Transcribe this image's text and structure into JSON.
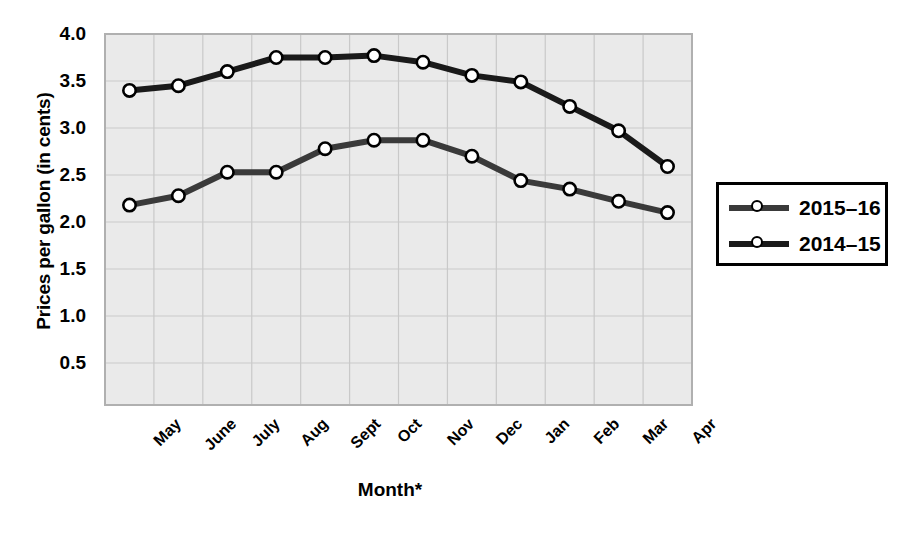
{
  "chart_data": {
    "type": "line",
    "title": "",
    "subtitle": "",
    "xlabel": "Month*",
    "ylabel": "Prices per gallon (in cents)",
    "categories": [
      "May",
      "June",
      "July",
      "Aug",
      "Sept",
      "Oct",
      "Nov",
      "Dec",
      "Jan",
      "Feb",
      "Mar",
      "Apr"
    ],
    "ylim": [
      0.25,
      4.0
    ],
    "yticks": [
      "4.0",
      "3.5",
      "3.0",
      "2.5",
      "2.0",
      "1.5",
      "1.0",
      "0.5"
    ],
    "ytick_values": [
      4.0,
      3.5,
      3.0,
      2.5,
      2.0,
      1.5,
      1.0,
      0.5
    ],
    "grid": true,
    "legend_position": "right",
    "series": [
      {
        "name": "2015–16",
        "color": "#3a3a3a",
        "values": [
          2.18,
          2.28,
          2.53,
          2.53,
          2.78,
          2.87,
          2.87,
          2.7,
          2.44,
          2.35,
          2.22,
          2.1
        ]
      },
      {
        "name": "2014–15",
        "color": "#1a1a1a",
        "values": [
          3.4,
          3.45,
          3.6,
          3.75,
          3.75,
          3.77,
          3.7,
          3.56,
          3.49,
          3.23,
          2.97,
          2.59
        ]
      }
    ],
    "annotations": []
  },
  "figure": {
    "plot_background": "#eaeaea",
    "grid_color": "#c9c9c9",
    "frame_color": "#b0b0b0",
    "marker_fill": "#ffffff",
    "marker_stroke": "#000000"
  },
  "legend": {
    "entries": [
      {
        "label": "2015–16",
        "swatch": "line-marker-swatch"
      },
      {
        "label": "2014–15",
        "swatch": "line-marker-swatch"
      }
    ]
  }
}
